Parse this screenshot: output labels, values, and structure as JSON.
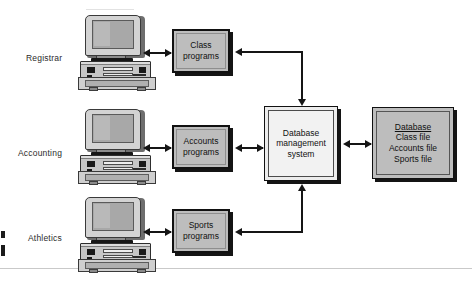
{
  "diagram": {
    "rows": [
      {
        "label": "Registrar",
        "workstation_name": "registrar-workstation",
        "program_box": "Class\nprograms",
        "program_line1": "Class",
        "program_line2": "programs"
      },
      {
        "label": "Accounting",
        "workstation_name": "accounting-workstation",
        "program_box": "Accounts\nprograms",
        "program_line1": "Accounts",
        "program_line2": "programs"
      },
      {
        "label": "Athletics",
        "workstation_name": "athletics-workstation",
        "program_box": "Sports\nprograms",
        "program_line1": "Sports",
        "program_line2": "programs"
      }
    ],
    "dbms": {
      "line1": "Database",
      "line2": "management",
      "line3": "system"
    },
    "database_file": {
      "header": "Database",
      "files": [
        "Class file",
        "Accounts file",
        "Sports file"
      ]
    },
    "colors": {
      "box_fill": "#bdbdbd",
      "dbms_fill": "#f2f2f2",
      "line": "#151515",
      "text": "#111111",
      "page_background": "#ffffff"
    }
  }
}
